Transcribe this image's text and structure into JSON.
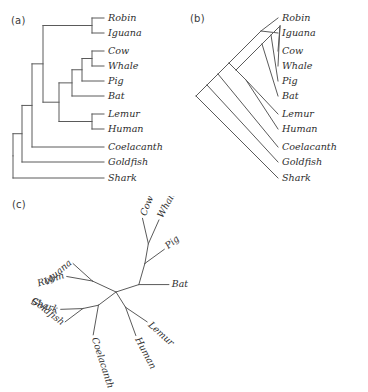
{
  "figure": {
    "panels": [
      {
        "id": "a",
        "label": "(a)",
        "style": "rectangular-cladogram"
      },
      {
        "id": "b",
        "label": "(b)",
        "style": "slanted-cladogram"
      },
      {
        "id": "c",
        "label": "(c)",
        "style": "unrooted-radial-tree"
      }
    ],
    "taxa": [
      "Robin",
      "Iguana",
      "Cow",
      "Whale",
      "Pig",
      "Bat",
      "Lemur",
      "Human",
      "Coelacanth",
      "Goldfish",
      "Shark"
    ],
    "line_color": "#5a5a5a",
    "text_color": "#2e2e2e"
  },
  "panel_a": {
    "label": "(a)",
    "tips": [
      {
        "name": "Robin",
        "y": 18,
        "x": 104
      },
      {
        "name": "Iguana",
        "y": 33,
        "x": 104
      },
      {
        "name": "Cow",
        "y": 51,
        "x": 104
      },
      {
        "name": "Whale",
        "y": 66,
        "x": 104
      },
      {
        "name": "Pig",
        "y": 81,
        "x": 104
      },
      {
        "name": "Bat",
        "y": 96,
        "x": 104
      },
      {
        "name": "Lemur",
        "y": 114,
        "x": 104
      },
      {
        "name": "Human",
        "y": 129,
        "x": 104
      },
      {
        "name": "Coelacanth",
        "y": 147,
        "x": 104
      },
      {
        "name": "Goldfish",
        "y": 162,
        "x": 104
      },
      {
        "name": "Shark",
        "y": 178,
        "x": 104
      }
    ],
    "nodes": [
      {
        "name": "robin-iguana",
        "x": 92,
        "children": [
          "Robin",
          "Iguana"
        ]
      },
      {
        "name": "cow-whale",
        "x": 92,
        "children": [
          "Cow",
          "Whale"
        ]
      },
      {
        "name": "cow-whale-pig",
        "x": 82,
        "children": [
          "cow-whale",
          "Pig"
        ]
      },
      {
        "name": "artiodactyl-bat",
        "x": 72,
        "children": [
          "cow-whale-pig",
          "Bat"
        ]
      },
      {
        "name": "lemur-human",
        "x": 92,
        "children": [
          "Lemur",
          "Human"
        ]
      },
      {
        "name": "mammals",
        "x": 59,
        "children": [
          "artiodactyl-bat",
          "lemur-human"
        ]
      },
      {
        "name": "amniotes",
        "x": 43,
        "children": [
          "robin-iguana",
          "mammals"
        ]
      },
      {
        "name": "tetrapod-coel",
        "x": 32,
        "children": [
          "amniotes",
          "Coelacanth"
        ]
      },
      {
        "name": "bony-fish",
        "x": 22,
        "children": [
          "tetrapod-coel",
          "Goldfish"
        ]
      },
      {
        "name": "root",
        "x": 13,
        "children": [
          "bony-fish",
          "Shark"
        ]
      }
    ]
  },
  "panel_b": {
    "label": "(b)",
    "root": {
      "x": 196,
      "y": 96
    },
    "tips": [
      {
        "name": "Robin",
        "y": 18,
        "x": 278
      },
      {
        "name": "Iguana",
        "y": 33,
        "x": 278
      },
      {
        "name": "Cow",
        "y": 51,
        "x": 278
      },
      {
        "name": "Whale",
        "y": 66,
        "x": 278
      },
      {
        "name": "Pig",
        "y": 81,
        "x": 278
      },
      {
        "name": "Bat",
        "y": 96,
        "x": 278
      },
      {
        "name": "Lemur",
        "y": 114,
        "x": 278
      },
      {
        "name": "Human",
        "y": 129,
        "x": 278
      },
      {
        "name": "Coelacanth",
        "y": 147,
        "x": 278
      },
      {
        "name": "Goldfish",
        "y": 162,
        "x": 278
      },
      {
        "name": "Shark",
        "y": 178,
        "x": 278
      }
    ]
  },
  "panel_c": {
    "label": "(c)",
    "center": {
      "x": 116,
      "y": 292
    },
    "tips": [
      {
        "name": "Cow",
        "angle": -74,
        "label_rotation": -68
      },
      {
        "name": "Whale",
        "angle": -62,
        "label_rotation": -62
      },
      {
        "name": "Pig",
        "angle": -40,
        "label_rotation": -40
      },
      {
        "name": "Bat",
        "angle": 0,
        "label_rotation": 0
      },
      {
        "name": "Lemur",
        "angle": 42,
        "label_rotation": 42
      },
      {
        "name": "Human",
        "angle": 62,
        "label_rotation": 62
      },
      {
        "name": "Coelacanth",
        "angle": 74,
        "label_rotation": 72
      },
      {
        "name": "Goldfish",
        "angle": 140,
        "label_rotation": 38
      },
      {
        "name": "Shark",
        "angle": 160,
        "label_rotation": 18
      },
      {
        "name": "Robin",
        "angle": 198,
        "label_rotation": -18
      },
      {
        "name": "Iguana",
        "angle": 215,
        "label_rotation": -40
      }
    ]
  }
}
